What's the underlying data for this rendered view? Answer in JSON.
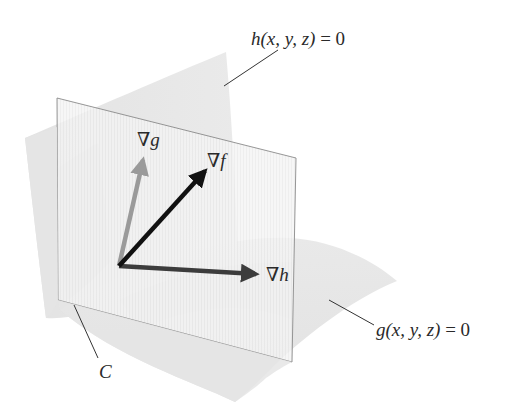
{
  "figure": {
    "background": "#ffffff",
    "colors": {
      "surface_fill": "#e6e6e6",
      "surface_shadow": "#d6d6d6",
      "plane_fill": "#f3f3f3",
      "plane_edge": "#8a8a8a",
      "grad_f": "#111111",
      "grad_g": "#9a9a9a",
      "grad_h": "#3c3c3c",
      "leader_line": "#333333",
      "label_text": "#2a2a2a"
    }
  },
  "labels": {
    "h_surface": {
      "func": "h",
      "args": "(x, y, z)",
      "eq": " = 0"
    },
    "g_surface": {
      "func": "g",
      "args": "(x, y, z)",
      "eq": " = 0"
    },
    "curve": "C",
    "grad_g": {
      "nabla": "∇",
      "var": "g"
    },
    "grad_f": {
      "nabla": "∇",
      "var": "f"
    },
    "grad_h": {
      "nabla": "∇",
      "var": "h"
    }
  },
  "vectors": {
    "origin": [
      119,
      266
    ],
    "grad_g_tip": [
      144,
      154
    ],
    "grad_f_tip": [
      210,
      166
    ],
    "grad_h_tip": [
      262,
      274
    ]
  }
}
